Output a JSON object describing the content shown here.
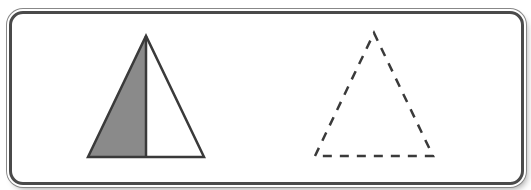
{
  "figure": {
    "colors": {
      "outline": "#3a3a3a",
      "shaded": "#8a8a8a",
      "background": "#ffffff"
    },
    "shapes": [
      {
        "name": "split-triangle",
        "style": "solid",
        "left_half": "shaded",
        "right_half": "unshaded",
        "vertices": [
          [
            88,
            157
          ],
          [
            146,
            36
          ],
          [
            204,
            157
          ]
        ],
        "divider_x": 146
      },
      {
        "name": "dashed-triangle",
        "style": "dashed",
        "vertices": [
          [
            315,
            156
          ],
          [
            374,
            33
          ],
          [
            433,
            156
          ]
        ]
      }
    ]
  }
}
